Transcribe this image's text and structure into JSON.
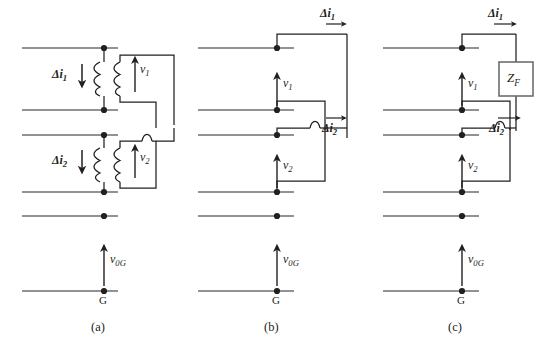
{
  "figure": {
    "type": "circuit-diagram",
    "panel_count": 3
  },
  "panels": [
    {
      "id": "a",
      "caption": "(a)",
      "kind": "transformer-coupled",
      "bus_lines": 6,
      "node_dots": 6,
      "elements": [
        "transformer-1",
        "transformer-2",
        "secondary-loop-wire",
        "wire-hop"
      ],
      "labels": {
        "delta_i1": "Δi",
        "delta_i1_sub": "1",
        "delta_i2": "Δi",
        "delta_i2_sub": "2",
        "v1": "v",
        "v1_sub": "1",
        "v2": "v",
        "v2_sub": "2",
        "v0g": "v",
        "v0g_sub": "0G",
        "ground": "G"
      }
    },
    {
      "id": "b",
      "caption": "(b)",
      "kind": "equivalent-source",
      "bus_lines": 6,
      "node_dots": 6,
      "elements": [
        "injection-loop-upper",
        "injection-loop-lower",
        "wire-hop"
      ],
      "labels": {
        "delta_i1": "Δi",
        "delta_i1_sub": "1",
        "delta_i2": "Δi",
        "delta_i2_sub": "2",
        "v1": "v",
        "v1_sub": "1",
        "v2": "v",
        "v2_sub": "2",
        "v0g": "v",
        "v0g_sub": "0G",
        "ground": "G"
      }
    },
    {
      "id": "c",
      "caption": "(c)",
      "kind": "fault-impedance",
      "bus_lines": 6,
      "node_dots": 6,
      "elements": [
        "injection-loop-upper",
        "injection-loop-lower",
        "wire-hop",
        "impedance-box"
      ],
      "labels": {
        "delta_i1": "Δi",
        "delta_i1_sub": "1",
        "delta_i2": "Δi",
        "delta_i2_sub": "2",
        "v1": "v",
        "v1_sub": "1",
        "v2": "v",
        "v2_sub": "2",
        "v0g": "v",
        "v0g_sub": "0G",
        "ground": "G",
        "impedance": "Z",
        "impedance_sub": "F"
      }
    }
  ],
  "style": {
    "line_color": "#58595b",
    "wire_color": "#231f20",
    "bus_color": "#6d6e71",
    "background": "#ffffff"
  }
}
